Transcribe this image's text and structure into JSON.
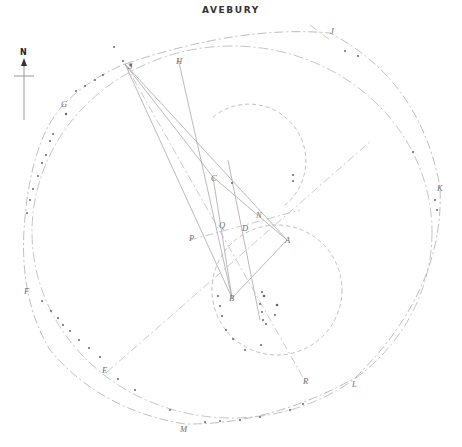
{
  "title": "AVEBURY",
  "north_arrow": {
    "label": "N",
    "x": 24,
    "y": 62
  },
  "colors": {
    "line": "#9a9a9a",
    "dash": "#b0b0b0",
    "stone": "#555555",
    "label": "#6e6e6e"
  },
  "points": [
    {
      "id": "S",
      "label": "S",
      "x": 125,
      "y": 64
    },
    {
      "id": "H",
      "label": "H",
      "x": 178,
      "y": 58
    },
    {
      "id": "J",
      "label": "J",
      "x": 332,
      "y": 31
    },
    {
      "id": "G",
      "label": "G",
      "x": 64,
      "y": 103
    },
    {
      "id": "K",
      "label": "K",
      "x": 439,
      "y": 187
    },
    {
      "id": "C",
      "label": "C",
      "x": 213,
      "y": 177
    },
    {
      "id": "N",
      "label": "N",
      "x": 258,
      "y": 215
    },
    {
      "id": "Q",
      "label": "Q",
      "x": 221,
      "y": 225
    },
    {
      "id": "D",
      "label": "D",
      "x": 244,
      "y": 228
    },
    {
      "id": "P",
      "label": "P",
      "x": 191,
      "y": 238
    },
    {
      "id": "A",
      "label": "A",
      "x": 287,
      "y": 240
    },
    {
      "id": "B",
      "label": "B",
      "x": 231,
      "y": 298
    },
    {
      "id": "F",
      "label": "F",
      "x": 26,
      "y": 291
    },
    {
      "id": "E",
      "label": "E",
      "x": 104,
      "y": 370
    },
    {
      "id": "R",
      "label": "R",
      "x": 305,
      "y": 381
    },
    {
      "id": "L",
      "label": "L",
      "x": 354,
      "y": 384
    },
    {
      "id": "M",
      "label": "M",
      "x": 183,
      "y": 429
    }
  ]
}
